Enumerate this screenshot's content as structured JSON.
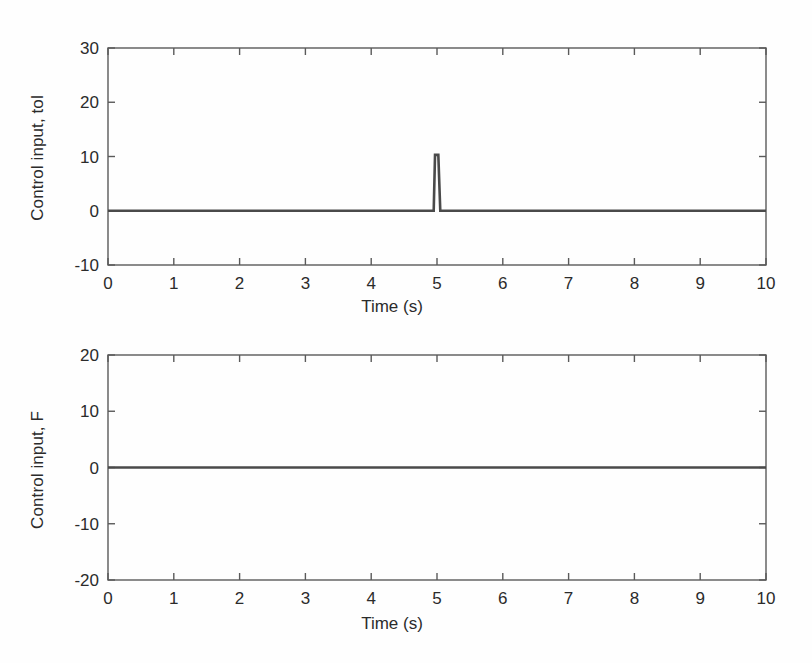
{
  "figure": {
    "background_color": "#fefefe",
    "axis_color": "#5a5a5a",
    "line_color": "#4a4a4a",
    "text_color": "#2b2b2b",
    "width": 812,
    "height": 663
  },
  "chart_data": [
    {
      "type": "line",
      "panel": "top",
      "title": "",
      "xlabel": "Time (s)",
      "ylabel": "Control input, tol",
      "xlim": [
        0,
        10
      ],
      "ylim": [
        -10,
        30
      ],
      "xticks": [
        0,
        1,
        2,
        3,
        4,
        5,
        6,
        7,
        8,
        9,
        10
      ],
      "xticklabels": [
        "0",
        "1",
        "2",
        "3",
        "4",
        "5",
        "6",
        "7",
        "8",
        "9",
        "10"
      ],
      "yticks": [
        -10,
        0,
        10,
        20,
        30
      ],
      "yticklabels": [
        "-10",
        "0",
        "10",
        "20",
        "30"
      ],
      "grid": false,
      "legend": null,
      "series": [
        {
          "name": "tol",
          "description": "Flat at 0 for the whole run with a single narrow upward impulse at t = 5 s peaking near 10.3",
          "x": [
            0,
            1,
            2,
            3,
            4,
            4.95,
            4.97,
            5.0,
            5.02,
            5.05,
            6,
            7,
            8,
            9,
            10
          ],
          "y": [
            0,
            0,
            0,
            0,
            0,
            0,
            10.3,
            10.3,
            10.3,
            0,
            0,
            0,
            0,
            0,
            0
          ]
        }
      ],
      "annotations": [
        {
          "text": "impulse",
          "x": 5.0,
          "y": 10.3
        }
      ]
    },
    {
      "type": "line",
      "panel": "bottom",
      "title": "",
      "xlabel": "Time (s)",
      "ylabel": "Control input, F",
      "xlim": [
        0,
        10
      ],
      "ylim": [
        -20,
        20
      ],
      "xticks": [
        0,
        1,
        2,
        3,
        4,
        5,
        6,
        7,
        8,
        9,
        10
      ],
      "xticklabels": [
        "0",
        "1",
        "2",
        "3",
        "4",
        "5",
        "6",
        "7",
        "8",
        "9",
        "10"
      ],
      "yticks": [
        -20,
        -10,
        0,
        10,
        20
      ],
      "yticklabels": [
        "-20",
        "-10",
        "0",
        "10",
        "20"
      ],
      "grid": false,
      "legend": null,
      "series": [
        {
          "name": "F",
          "description": "Flat at 0 across the entire time range",
          "x": [
            0,
            1,
            2,
            3,
            4,
            5,
            6,
            7,
            8,
            9,
            10
          ],
          "y": [
            0,
            0,
            0,
            0,
            0,
            0,
            0,
            0,
            0,
            0,
            0
          ]
        }
      ],
      "annotations": []
    }
  ]
}
